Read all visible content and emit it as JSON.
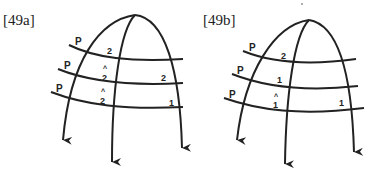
{
  "figures": [
    {
      "label": "[49a]",
      "p_labels": [
        "P",
        "P",
        "P"
      ],
      "tiers": [
        {
          "left": "2",
          "right": ""
        },
        {
          "left": "2",
          "left_mark": "^",
          "right": "2"
        },
        {
          "left": "2",
          "left_mark": "^",
          "right": "1"
        }
      ]
    },
    {
      "label": "[49b]",
      "p_labels": [
        "P",
        "P",
        "P"
      ],
      "tiers": [
        {
          "left": "2",
          "right": ""
        },
        {
          "left": "1",
          "right": ""
        },
        {
          "left": "1",
          "left_mark": "^",
          "right": "1"
        }
      ]
    }
  ],
  "colors": {
    "ink": "#222222",
    "background": "#ffffff"
  }
}
